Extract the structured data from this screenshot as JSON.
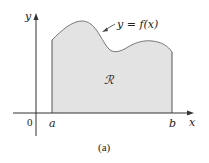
{
  "figure": {
    "caption": "(a)",
    "curve_label": "y = f(x)",
    "region_label": "ℛ",
    "axes": {
      "x_label": "x",
      "y_label": "y",
      "origin_label": "0",
      "a_label": "a",
      "b_label": "b"
    },
    "colors": {
      "region_fill": "#e3e3e3",
      "curve": "#777777",
      "axis": "#333333"
    }
  }
}
